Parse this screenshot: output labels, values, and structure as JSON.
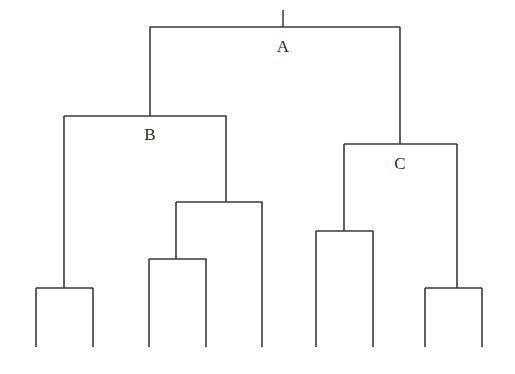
{
  "figure": {
    "kind": "dendrogram",
    "width": 515,
    "height": 374,
    "background_color": "#ffffff",
    "line_color": "#3a3a3a",
    "label_color": "#2b2b2b"
  },
  "labels": {
    "root": "A",
    "left_cluster": "B",
    "right_cluster": "C"
  },
  "label_positions": {
    "root": {
      "x": 283,
      "y": 38
    },
    "left_cluster": {
      "x": 150,
      "y": 126
    },
    "right_cluster": {
      "x": 400,
      "y": 155
    }
  },
  "chart_data": {
    "type": "dendrogram",
    "title": "",
    "leaf_count": 9,
    "leaves": [
      {
        "id": "L1",
        "x": 36,
        "bottom_y": 347
      },
      {
        "id": "L2",
        "x": 93,
        "bottom_y": 347
      },
      {
        "id": "L3",
        "x": 149,
        "bottom_y": 347
      },
      {
        "id": "L4",
        "x": 206,
        "bottom_y": 347
      },
      {
        "id": "L5",
        "x": 262,
        "bottom_y": 347
      },
      {
        "id": "L6",
        "x": 316,
        "bottom_y": 347
      },
      {
        "id": "L7",
        "x": 373,
        "bottom_y": 347
      },
      {
        "id": "L8",
        "x": 425,
        "bottom_y": 347
      },
      {
        "id": "L9",
        "x": 482,
        "bottom_y": 347
      }
    ],
    "nodes": [
      {
        "id": "A",
        "label": "A",
        "merge_y": 27,
        "left_x": 150,
        "right_x": 400,
        "center_x": 283,
        "stub_top_y": 10
      },
      {
        "id": "B",
        "label": "B",
        "merge_y": 116,
        "left_x": 64,
        "right_x": 226,
        "center_x": 150
      },
      {
        "id": "C",
        "label": "C",
        "merge_y": 144,
        "left_x": 344,
        "right_x": 457,
        "center_x": 400
      },
      {
        "id": "N4",
        "label": "",
        "merge_y": 202,
        "left_x": 176,
        "right_x": 262,
        "center_x": 226
      },
      {
        "id": "N5",
        "label": "",
        "merge_y": 231,
        "left_x": 316,
        "right_x": 373,
        "center_x": 344
      },
      {
        "id": "N6",
        "label": "",
        "merge_y": 259,
        "left_x": 149,
        "right_x": 206,
        "center_x": 176
      },
      {
        "id": "N7",
        "label": "",
        "merge_y": 288,
        "left_x": 36,
        "right_x": 93,
        "center_x": 64
      },
      {
        "id": "N8",
        "label": "",
        "merge_y": 288,
        "left_x": 425,
        "right_x": 482,
        "center_x": 457
      }
    ],
    "edges": [
      {
        "from": "A",
        "to": "B",
        "x": 150,
        "y1": 27,
        "y2": 116
      },
      {
        "from": "A",
        "to": "C",
        "x": 400,
        "y1": 27,
        "y2": 144
      },
      {
        "from": "B",
        "to": "N7",
        "x": 64,
        "y1": 116,
        "y2": 288
      },
      {
        "from": "B",
        "to": "N4",
        "x": 226,
        "y1": 116,
        "y2": 202
      },
      {
        "from": "C",
        "to": "N5",
        "x": 344,
        "y1": 144,
        "y2": 231
      },
      {
        "from": "C",
        "to": "N8",
        "x": 457,
        "y1": 144,
        "y2": 288
      },
      {
        "from": "N4",
        "to": "N6",
        "x": 176,
        "y1": 202,
        "y2": 259
      },
      {
        "from": "N4",
        "to": "L5",
        "x": 262,
        "y1": 202,
        "y2": 347
      },
      {
        "from": "N5",
        "to": "L6",
        "x": 316,
        "y1": 231,
        "y2": 347
      },
      {
        "from": "N5",
        "to": "L7",
        "x": 373,
        "y1": 231,
        "y2": 347
      },
      {
        "from": "N6",
        "to": "L3",
        "x": 149,
        "y1": 259,
        "y2": 347
      },
      {
        "from": "N6",
        "to": "L4",
        "x": 206,
        "y1": 259,
        "y2": 347
      },
      {
        "from": "N7",
        "to": "L1",
        "x": 36,
        "y1": 288,
        "y2": 347
      },
      {
        "from": "N7",
        "to": "L2",
        "x": 93,
        "y1": 288,
        "y2": 347
      },
      {
        "from": "N8",
        "to": "L8",
        "x": 425,
        "y1": 288,
        "y2": 347
      },
      {
        "from": "N8",
        "to": "L9",
        "x": 482,
        "y1": 288,
        "y2": 347
      }
    ],
    "xlabel": "",
    "ylabel": "",
    "grid": false,
    "legend": false
  }
}
